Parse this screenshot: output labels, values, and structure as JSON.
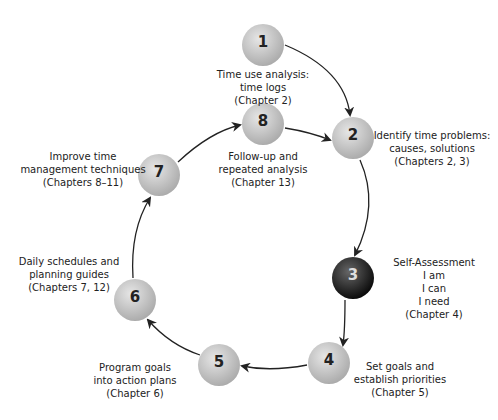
{
  "nodes": [
    {
      "id": "1",
      "lines": [
        "Time use analysis:",
        "time logs",
        "(Chapter 2)"
      ]
    },
    {
      "id": "2",
      "lines": [
        "Identify time problems:",
        "causes, solutions",
        "(Chapters 2, 3)"
      ]
    },
    {
      "id": "3",
      "lines": [
        "Self-Assessment",
        "I am",
        "I can",
        "I need",
        "(Chapter 4)"
      ]
    },
    {
      "id": "4",
      "lines": [
        "Set goals and",
        "establish priorities",
        "(Chapter 5)"
      ]
    },
    {
      "id": "5",
      "lines": [
        "Program goals",
        "into action plans",
        "(Chapter 6)"
      ]
    },
    {
      "id": "6",
      "lines": [
        "Daily schedules and",
        "planning guides",
        "(Chapters 7, 12)"
      ]
    },
    {
      "id": "7",
      "lines": [
        "Improve time",
        "management techniques",
        "(Chapters 8–11)"
      ]
    },
    {
      "id": "8",
      "lines": [
        "Follow-up and",
        "repeated analysis",
        "(Chapter 13)"
      ]
    }
  ],
  "colors": {
    "node_fill": "#c8c8c8",
    "highlight_fill": "#1a1a1a",
    "arrow": "#222222",
    "text": "#222222"
  }
}
